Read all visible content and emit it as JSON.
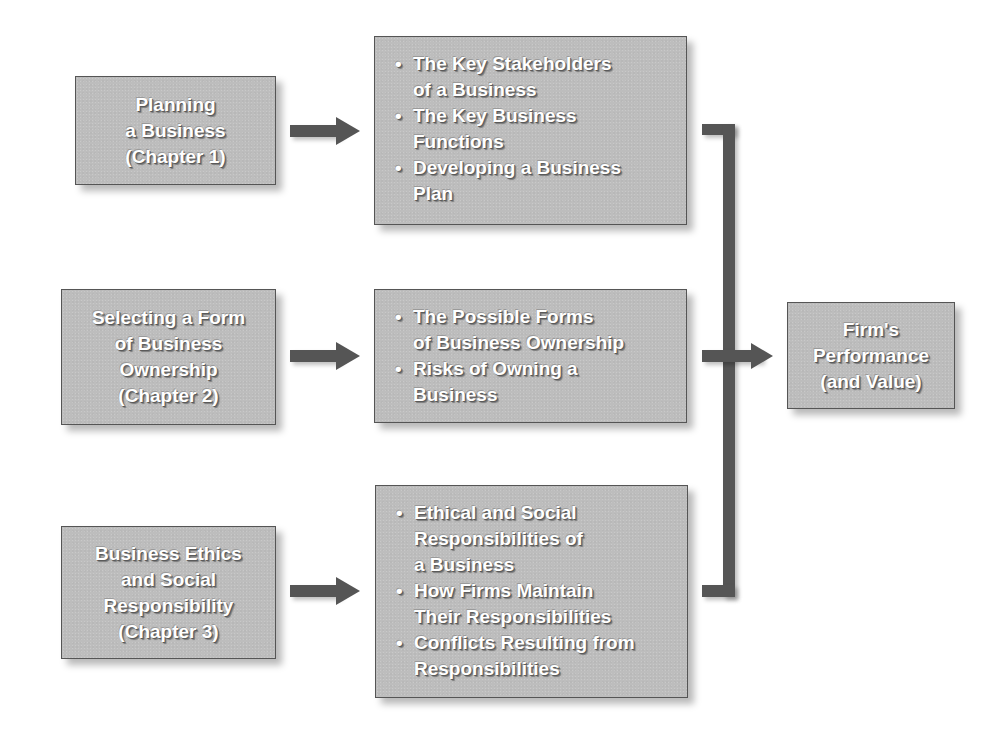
{
  "diagram": {
    "type": "flow",
    "colors": {
      "box_fill": "#bdbdbd",
      "box_border": "#555555",
      "connector": "#555555",
      "text": "#ffffff"
    },
    "chapters": [
      {
        "lines": [
          "Planning",
          "a Business",
          "(Chapter 1)"
        ]
      },
      {
        "lines": [
          "Selecting a Form",
          "of Business",
          "Ownership",
          "(Chapter 2)"
        ]
      },
      {
        "lines": [
          "Business Ethics",
          "and Social",
          "Responsibility",
          "(Chapter 3)"
        ]
      }
    ],
    "topics": [
      {
        "items": [
          [
            "The Key Stakeholders",
            "of a Business"
          ],
          [
            "The Key Business",
            "Functions"
          ],
          [
            "Developing a Business",
            "Plan"
          ]
        ]
      },
      {
        "items": [
          [
            "The Possible Forms",
            "of Business Ownership"
          ],
          [
            "Risks of Owning a",
            "Business"
          ]
        ]
      },
      {
        "items": [
          [
            "Ethical and Social",
            "Responsibilities of",
            "a Business"
          ],
          [
            "How Firms Maintain",
            "Their Responsibilities"
          ],
          [
            "Conflicts Resulting from",
            "Responsibilities"
          ]
        ]
      }
    ],
    "outcome": {
      "lines": [
        "Firm's",
        "Performance",
        "(and Value)"
      ]
    },
    "edges": [
      {
        "from": "chapter-1",
        "to": "topics-1"
      },
      {
        "from": "chapter-2",
        "to": "topics-2"
      },
      {
        "from": "chapter-3",
        "to": "topics-3"
      },
      {
        "from": "topics-1",
        "to": "outcome"
      },
      {
        "from": "topics-2",
        "to": "outcome"
      },
      {
        "from": "topics-3",
        "to": "outcome"
      }
    ]
  }
}
